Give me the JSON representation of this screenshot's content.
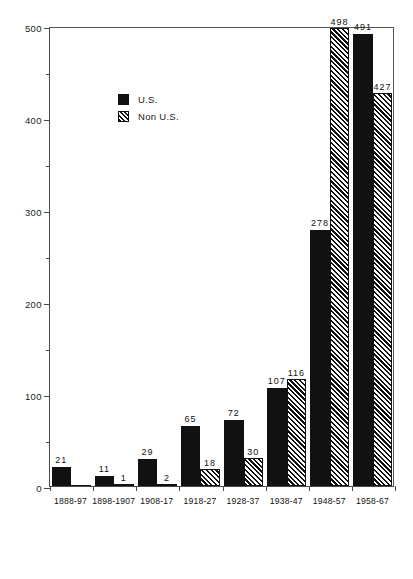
{
  "chart_data": {
    "type": "bar",
    "title": "",
    "subtitle": "",
    "xlabel": "",
    "ylabel": "",
    "ylim": [
      0,
      500
    ],
    "xlim_note": "categorical",
    "grid": false,
    "legend_position": "top-left inside plot",
    "y_major_ticks": [
      0,
      100,
      200,
      300,
      400,
      500
    ],
    "y_minor_ticks": [
      50,
      150,
      250,
      350,
      450
    ],
    "y_tick_labels": [
      "0",
      "100",
      "200",
      "300",
      "400",
      "500"
    ],
    "categories": [
      "1888-97",
      "1898-1907",
      "1908-17",
      "1918-27",
      "1928-37",
      "1938-47",
      "1948-57",
      "1958-67"
    ],
    "series": [
      {
        "name": "U.S.",
        "fill": "solid-black",
        "color": "#111111",
        "values": [
          21,
          11,
          29,
          65,
          72,
          107,
          278,
          491
        ],
        "value_labels": [
          "21",
          "11",
          "29",
          "65",
          "72",
          "107",
          "278",
          "491"
        ]
      },
      {
        "name": "Non U.S.",
        "fill": "diagonal-hatch",
        "color": "#101010",
        "values": [
          0,
          1,
          2,
          18,
          30,
          116,
          498,
          427
        ],
        "value_labels": [
          "",
          "1",
          "2",
          "18",
          "30",
          "116",
          "498",
          "427"
        ]
      }
    ]
  },
  "legend": {
    "items": [
      {
        "label": "U.S."
      },
      {
        "label": "Non U.S."
      }
    ]
  },
  "colors": {
    "bar_us": "#111111",
    "bar_nonus_line": "#101010",
    "axis": "#4a4a4a",
    "text": "#111111",
    "background": "#ffffff"
  }
}
